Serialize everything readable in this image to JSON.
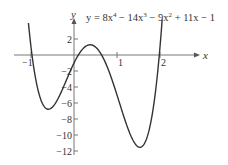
{
  "chart_data": {
    "type": "line",
    "equation": {
      "coefficients": [
        8,
        -14,
        -9,
        11,
        -1
      ],
      "text_parts": [
        "y = 8x",
        "4",
        " − 14x",
        "3",
        " − 9x",
        "2",
        " + 11x − 1"
      ]
    },
    "xlabel": "x",
    "ylabel": "y",
    "x_ticks": [
      -1,
      1,
      2
    ],
    "y_ticks": [
      2,
      -2,
      -4,
      -6,
      -8,
      -10,
      -12
    ],
    "x_tick_labels": [
      "−1",
      "1",
      "2"
    ],
    "y_tick_labels": [
      "2",
      "−2",
      "−4",
      "−6",
      "−8",
      "−10",
      "−12"
    ],
    "xlim": [
      -1.3,
      3.4
    ],
    "ylim": [
      -13,
      6
    ],
    "domain": [
      -1.06,
      2.05
    ],
    "grid": false,
    "legend": "none",
    "series": [
      {
        "name": "y = 8x⁴ − 14x³ − 9x² + 11x − 1",
        "x": [
          -1.0,
          -0.75,
          -0.55,
          -0.25,
          0,
          0.25,
          0.4,
          0.75,
          1.0,
          1.25,
          1.5,
          1.75,
          2.0
        ],
        "values": [
          3.0,
          -4.9,
          -6.5,
          -4.3,
          -1.0,
          1.16,
          1.3,
          -1.2,
          -5.0,
          -9.5,
          -11.5,
          -8.2,
          1.0
        ]
      }
    ],
    "key_points": {
      "local_min_left": [
        -0.55,
        -6.5
      ],
      "local_max": [
        0.4,
        1.3
      ],
      "local_min_right": [
        1.5,
        -11.5
      ]
    }
  },
  "axes": {
    "x_label": "x",
    "y_label": "y"
  }
}
